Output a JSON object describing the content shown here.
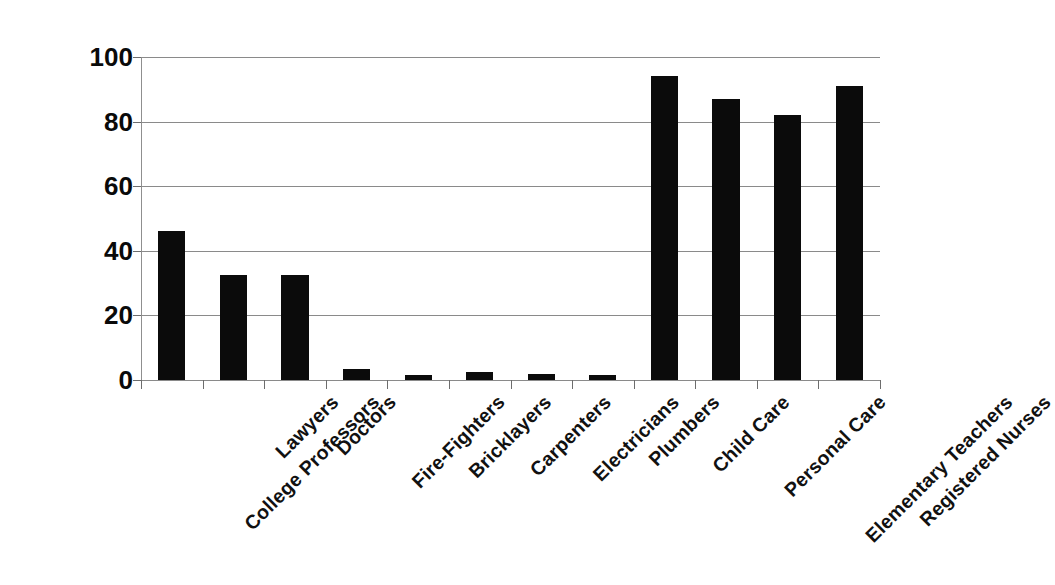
{
  "chart_data": {
    "type": "bar",
    "title": "",
    "subtitle": "",
    "xlabel": "",
    "ylabel": "",
    "ylim": [
      0,
      100
    ],
    "yticks": [
      0,
      20,
      40,
      60,
      80,
      100
    ],
    "grid": true,
    "legend": false,
    "legend_position": "none",
    "bar_color": "#0b0b0b",
    "gridline_color": "#8a8a8a",
    "background_color": "#ffffff",
    "categories": [
      "College Professors",
      "Lawyers",
      "Doctors",
      "Fire-Fighters",
      "Bricklayers",
      "Carpenters",
      "Electricians",
      "Plumbers",
      "Child Care",
      "Personal Care",
      "Elementary Teachers",
      "Registered Nurses"
    ],
    "values": [
      46,
      32.5,
      32.5,
      3.5,
      1.5,
      2.5,
      2,
      1.5,
      94,
      87,
      82,
      91
    ]
  }
}
